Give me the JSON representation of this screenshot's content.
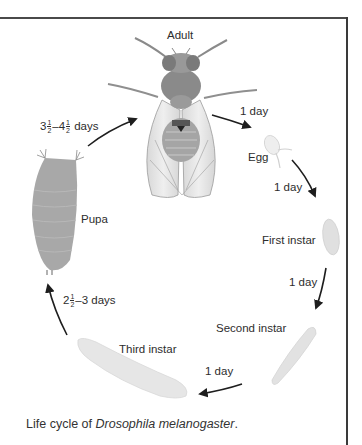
{
  "diagram": {
    "title": "Life cycle of Drosophila melanogaster",
    "stages": {
      "adult": "Adult",
      "egg": "Egg",
      "first_instar": "First instar",
      "second_instar": "Second instar",
      "third_instar": "Third instar",
      "pupa": "Pupa"
    },
    "durations": {
      "adult_to_egg": "1 day",
      "egg_to_first": "1 day",
      "first_to_second": "1 day",
      "second_to_third": "1 day",
      "third_to_pupa": {
        "whole": "2",
        "num": "1",
        "den": "2",
        "rest": "–3 days"
      },
      "pupa_to_adult": {
        "whole1": "3",
        "num1": "1",
        "den1": "2",
        "dash": "–4",
        "num2": "1",
        "den2": "2",
        "rest": " days"
      }
    },
    "colors": {
      "frame": "#3a3a3a",
      "arrow": "#1e1e1e",
      "larva": "#e4e4e4",
      "pupa": "#a8a8a8",
      "fly_body": "#8a8a8a"
    }
  },
  "caption": {
    "prefix": "Life cycle of ",
    "species": "Drosophila melanogaster",
    "suffix": "."
  }
}
